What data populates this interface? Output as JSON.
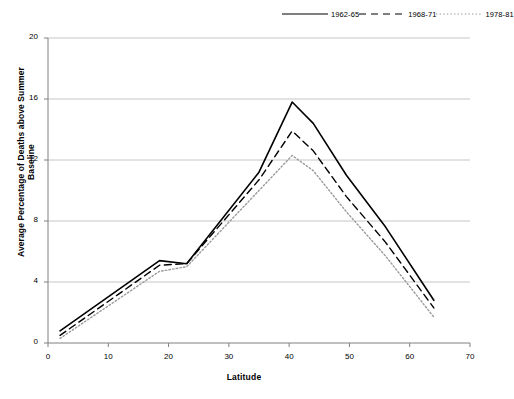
{
  "chart_data": {
    "type": "line",
    "title": "",
    "xlabel": "Latitude",
    "ylabel": "Average Percentage of Deaths above Summer Baseline",
    "xlim": [
      0,
      70
    ],
    "ylim": [
      0,
      20
    ],
    "xticks": [
      0,
      10,
      20,
      30,
      40,
      50,
      60,
      70
    ],
    "yticks": [
      0,
      4,
      8,
      12,
      16,
      20
    ],
    "grid": "horizontal",
    "legend_position": "top-right",
    "series": [
      {
        "name": "1962-65",
        "style": "solid",
        "color": "#000000",
        "x": [
          2,
          18.5,
          23,
          35,
          40.5,
          44,
          49.5,
          56,
          64
        ],
        "y": [
          0.8,
          5.4,
          5.2,
          11.2,
          15.8,
          14.4,
          11.0,
          7.6,
          2.8
        ]
      },
      {
        "name": "1968-71",
        "style": "dashed",
        "color": "#000000",
        "x": [
          2,
          18.5,
          23,
          35,
          40.5,
          44,
          49.5,
          56,
          64
        ],
        "y": [
          0.5,
          5.1,
          5.2,
          10.7,
          13.9,
          12.6,
          9.6,
          6.6,
          2.3
        ]
      },
      {
        "name": "1978-81",
        "style": "dotted",
        "color": "#9a9a9a",
        "x": [
          2,
          18.5,
          23,
          35,
          40.5,
          44,
          49.5,
          56,
          64
        ],
        "y": [
          0.3,
          4.7,
          5.0,
          10.0,
          12.3,
          11.3,
          8.6,
          5.7,
          1.7
        ]
      }
    ]
  }
}
